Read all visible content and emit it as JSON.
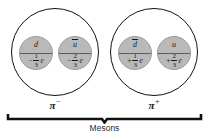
{
  "figure": {
    "caption": "Mesons",
    "colors": {
      "background": "#ffffff",
      "quark_fill": "#b9b9b9",
      "outline": "#111111",
      "text": "#1a1a1a"
    },
    "mesons": [
      {
        "name": "pi-minus",
        "label_symbol": "π",
        "label_superscript": "−",
        "quarks": [
          {
            "name": "down-quark",
            "symbol": "d",
            "antiparticle": false,
            "charge_sign": "−",
            "charge_numerator": "1",
            "charge_denominator": "3",
            "charge_unit": "e"
          },
          {
            "name": "up-antiquark",
            "symbol": "u",
            "antiparticle": true,
            "charge_sign": "−",
            "charge_numerator": "2",
            "charge_denominator": "3",
            "charge_unit": "e"
          }
        ]
      },
      {
        "name": "pi-plus",
        "label_symbol": "π",
        "label_superscript": "+",
        "quarks": [
          {
            "name": "down-antiquark",
            "symbol": "d",
            "antiparticle": true,
            "charge_sign": "+",
            "charge_numerator": "1",
            "charge_denominator": "3",
            "charge_unit": "e"
          },
          {
            "name": "up-quark",
            "symbol": "u",
            "antiparticle": false,
            "charge_sign": "+",
            "charge_numerator": "2",
            "charge_denominator": "3",
            "charge_unit": "e"
          }
        ]
      }
    ]
  }
}
